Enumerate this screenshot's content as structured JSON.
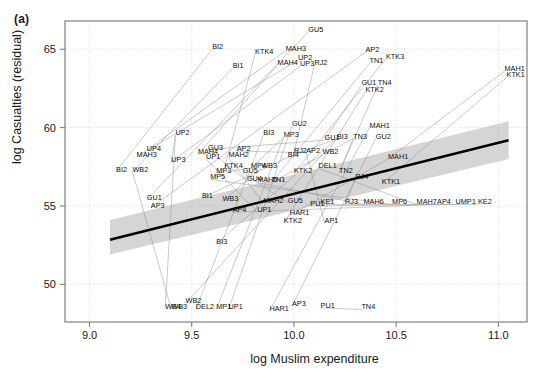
{
  "figure": {
    "panel_tag": "(a)",
    "background": "#ffffff"
  },
  "axes": {
    "x_label": "log Muslim expenditure",
    "y_label": "log Casualties (residual)",
    "x_ticks": [
      "9.0",
      "9.5",
      "10.0",
      "10.5",
      "11.0"
    ],
    "y_ticks": [
      "50",
      "55",
      "60",
      "65"
    ],
    "grid": "dotted-light-gray",
    "panel_border_color": "#808080"
  },
  "chart_data": {
    "type": "scatter",
    "title": "",
    "subtitle": "",
    "xlabel": "log Muslim expenditure",
    "ylabel": "log Casualties (residual)",
    "xlim": [
      8.88,
      11.14
    ],
    "ylim": [
      47.6,
      66.8
    ],
    "xticks": [
      9.0,
      9.5,
      10.0,
      10.5,
      11.0
    ],
    "yticks": [
      50,
      55,
      60,
      65
    ],
    "grid": true,
    "legend": "none",
    "regression_line": {
      "label": "fitted line",
      "color": "#000000",
      "x": [
        9.1,
        11.05
      ],
      "y": [
        52.85,
        59.2
      ]
    },
    "confidence_band": {
      "label": "95% confidence band",
      "color": "#b3b3b3",
      "x": [
        9.1,
        11.05
      ],
      "y_lower": [
        51.9,
        58.0
      ],
      "y_upper": [
        54.1,
        60.4
      ]
    },
    "connector_lines_color": "#8c8c8c",
    "points": [
      {
        "label": "GU5",
        "x": 10.07,
        "y": 66.1
      },
      {
        "label": "BI2",
        "x": 9.6,
        "y": 65.0
      },
      {
        "label": "KTK4",
        "x": 9.81,
        "y": 64.7
      },
      {
        "label": "MAH3",
        "x": 9.96,
        "y": 64.9
      },
      {
        "label": "AP2",
        "x": 10.35,
        "y": 64.8
      },
      {
        "label": "KTK3",
        "x": 10.45,
        "y": 64.4
      },
      {
        "label": "UP2",
        "x": 10.02,
        "y": 64.3
      },
      {
        "label": "MAH4",
        "x": 9.92,
        "y": 64.0
      },
      {
        "label": "UP3",
        "x": 10.03,
        "y": 63.9
      },
      {
        "label": "RJ2",
        "x": 10.1,
        "y": 64.0
      },
      {
        "label": "TN1",
        "x": 10.37,
        "y": 64.1
      },
      {
        "label": "BI1",
        "x": 9.7,
        "y": 63.8
      },
      {
        "label": "MAH1",
        "x": 11.03,
        "y": 63.6
      },
      {
        "label": "KTK1",
        "x": 11.04,
        "y": 63.2
      },
      {
        "label": "GU1",
        "x": 10.33,
        "y": 62.7
      },
      {
        "label": "TN4",
        "x": 10.41,
        "y": 62.7
      },
      {
        "label": "KTK2",
        "x": 10.35,
        "y": 62.3
      },
      {
        "label": "GU2b",
        "x": 9.99,
        "y": 60.1
      },
      {
        "label": "MAH1b",
        "x": 10.37,
        "y": 60.0
      },
      {
        "label": "UP2b",
        "x": 9.42,
        "y": 59.5
      },
      {
        "label": "BI3",
        "x": 9.85,
        "y": 59.5
      },
      {
        "label": "MP3",
        "x": 9.95,
        "y": 59.4
      },
      {
        "label": "GU2",
        "x": 10.4,
        "y": 59.3
      },
      {
        "label": "BI3b",
        "x": 10.21,
        "y": 59.3
      },
      {
        "label": "TN3",
        "x": 10.29,
        "y": 59.3
      },
      {
        "label": "GU1b",
        "x": 10.15,
        "y": 59.2
      },
      {
        "label": "UP4",
        "x": 9.28,
        "y": 58.5
      },
      {
        "label": "GU3",
        "x": 9.58,
        "y": 58.6
      },
      {
        "label": "AP2b",
        "x": 9.72,
        "y": 58.5
      },
      {
        "label": "MAH4b",
        "x": 9.53,
        "y": 58.3
      },
      {
        "label": "RJ2b",
        "x": 10.0,
        "y": 58.4
      },
      {
        "label": "AP2c",
        "x": 10.06,
        "y": 58.4
      },
      {
        "label": "WB2",
        "x": 10.14,
        "y": 58.3
      },
      {
        "label": "MAH3b",
        "x": 9.23,
        "y": 58.1
      },
      {
        "label": "MAH2",
        "x": 9.68,
        "y": 58.1
      },
      {
        "label": "UP1",
        "x": 9.57,
        "y": 58.0
      },
      {
        "label": "BI4",
        "x": 9.97,
        "y": 58.1
      },
      {
        "label": "MAH1c",
        "x": 10.46,
        "y": 58.0
      },
      {
        "label": "UP3b",
        "x": 9.4,
        "y": 57.8
      },
      {
        "label": "KTK4b",
        "x": 9.66,
        "y": 57.4
      },
      {
        "label": "MP4",
        "x": 9.79,
        "y": 57.4
      },
      {
        "label": "WB3",
        "x": 9.84,
        "y": 57.4
      },
      {
        "label": "DEL1",
        "x": 10.12,
        "y": 57.4
      },
      {
        "label": "BI2b",
        "x": 9.13,
        "y": 57.2
      },
      {
        "label": "WB2b",
        "x": 9.21,
        "y": 57.2
      },
      {
        "label": "MP3b",
        "x": 9.62,
        "y": 57.1
      },
      {
        "label": "GU5b",
        "x": 9.75,
        "y": 57.1
      },
      {
        "label": "KTK2b",
        "x": 10.0,
        "y": 57.1
      },
      {
        "label": "TN2",
        "x": 10.22,
        "y": 57.1
      },
      {
        "label": "MP5",
        "x": 9.59,
        "y": 56.7
      },
      {
        "label": "GU4",
        "x": 9.77,
        "y": 56.6
      },
      {
        "label": "MAH5",
        "x": 9.82,
        "y": 56.5
      },
      {
        "label": "TN1b",
        "x": 9.89,
        "y": 56.5
      },
      {
        "label": "RJ4",
        "x": 10.3,
        "y": 56.7
      },
      {
        "label": "KTK1b",
        "x": 10.43,
        "y": 56.4
      },
      {
        "label": "GU1c",
        "x": 9.28,
        "y": 55.4
      },
      {
        "label": "BI1b",
        "x": 9.55,
        "y": 55.5
      },
      {
        "label": "WB3b",
        "x": 9.65,
        "y": 55.3
      },
      {
        "label": "MAH2b",
        "x": 9.85,
        "y": 55.2
      },
      {
        "label": "GU5c",
        "x": 9.97,
        "y": 55.2
      },
      {
        "label": "KE1",
        "x": 10.13,
        "y": 55.1
      },
      {
        "label": "RJ3",
        "x": 10.25,
        "y": 55.1
      },
      {
        "label": "MAH6",
        "x": 10.34,
        "y": 55.1
      },
      {
        "label": "MP6",
        "x": 10.48,
        "y": 55.1
      },
      {
        "label": "MAH7",
        "x": 10.6,
        "y": 55.1
      },
      {
        "label": "AP4b",
        "x": 10.7,
        "y": 55.1
      },
      {
        "label": "UMP1",
        "x": 10.79,
        "y": 55.1
      },
      {
        "label": "KE2",
        "x": 10.9,
        "y": 55.1
      },
      {
        "label": "AP3",
        "x": 9.3,
        "y": 54.9
      },
      {
        "label": "AP4",
        "x": 9.7,
        "y": 54.6
      },
      {
        "label": "UP1b",
        "x": 9.82,
        "y": 54.6
      },
      {
        "label": "KTK2c",
        "x": 9.95,
        "y": 53.9
      },
      {
        "label": "AP1",
        "x": 10.15,
        "y": 53.9
      },
      {
        "label": "BI3c",
        "x": 9.62,
        "y": 52.6
      },
      {
        "label": "WB4",
        "x": 9.37,
        "y": 48.4
      },
      {
        "label": "WB3c",
        "x": 9.4,
        "y": 48.4
      },
      {
        "label": "DEL2",
        "x": 9.52,
        "y": 48.4
      },
      {
        "label": "MP1",
        "x": 9.62,
        "y": 48.4
      },
      {
        "label": "UP1c",
        "x": 9.68,
        "y": 48.4
      },
      {
        "label": "HAR1",
        "x": 9.88,
        "y": 48.3
      },
      {
        "label": "AP3b",
        "x": 9.99,
        "y": 48.6
      },
      {
        "label": "PU1",
        "x": 10.13,
        "y": 48.5
      },
      {
        "label": "TN4b",
        "x": 10.33,
        "y": 48.4
      },
      {
        "label": "WB2c",
        "x": 9.47,
        "y": 48.8
      },
      {
        "label": "PU1b",
        "x": 10.08,
        "y": 55.0
      },
      {
        "label": "HAR1b",
        "x": 9.98,
        "y": 54.4
      }
    ],
    "connectors": [
      {
        "from": "BI2b",
        "to": "BI2"
      },
      {
        "from": "WB2b",
        "to": "BI1"
      },
      {
        "from": "GU1c",
        "to": "GU5"
      },
      {
        "from": "AP3",
        "to": "AP2"
      },
      {
        "from": "UP4",
        "to": "UP2"
      },
      {
        "from": "MAH3b",
        "to": "MAH3"
      },
      {
        "from": "UP3b",
        "to": "UP3"
      },
      {
        "from": "KTK4b",
        "to": "KTK4"
      },
      {
        "from": "MAH4b",
        "to": "MAH4"
      },
      {
        "from": "RJ2b",
        "to": "RJ2"
      },
      {
        "from": "TN1b",
        "to": "TN1"
      },
      {
        "from": "KTK2b",
        "to": "KTK3"
      },
      {
        "from": "KTK1b",
        "to": "KTK1"
      },
      {
        "from": "MAH1c",
        "to": "MAH1"
      },
      {
        "from": "GU1b",
        "to": "GU1"
      },
      {
        "from": "TN2",
        "to": "TN4"
      },
      {
        "from": "WB4",
        "to": "UP2b"
      },
      {
        "from": "DEL2",
        "to": "BI3"
      },
      {
        "from": "MP1",
        "to": "MP3"
      },
      {
        "from": "UP1c",
        "to": "GU2b"
      },
      {
        "from": "HAR1",
        "to": "MAH1b"
      },
      {
        "from": "AP3b",
        "to": "GU2"
      },
      {
        "from": "PU1",
        "to": "TN4b"
      },
      {
        "from": "BI3c",
        "to": "BI3b"
      },
      {
        "from": "WB2c",
        "to": "WB2"
      },
      {
        "from": "KTK2c",
        "to": "KTK2"
      },
      {
        "from": "AP1",
        "to": "AP2c"
      },
      {
        "from": "AP4",
        "to": "AP4b"
      },
      {
        "from": "UP1b",
        "to": "UP1"
      },
      {
        "from": "MP3b",
        "to": "MP4"
      },
      {
        "from": "GU5b",
        "to": "GU5c"
      },
      {
        "from": "MAH2b",
        "to": "MAH2"
      },
      {
        "from": "WB3b",
        "to": "WB3"
      },
      {
        "from": "BI1b",
        "to": "BI4"
      },
      {
        "from": "MP5",
        "to": "MP6"
      },
      {
        "from": "GU4",
        "to": "GU3"
      },
      {
        "from": "MAH5",
        "to": "MAH6"
      },
      {
        "from": "RJ3",
        "to": "RJ4"
      },
      {
        "from": "KE1",
        "to": "KE2"
      },
      {
        "from": "TN3",
        "to": "TN2"
      },
      {
        "from": "DEL1",
        "to": "MAH7"
      },
      {
        "from": "WB3c",
        "to": "WB2b"
      },
      {
        "from": "PU1b",
        "to": "UMP1"
      },
      {
        "from": "HAR1b",
        "to": "MAH1c"
      },
      {
        "from": "AP2b",
        "to": "AP2c"
      },
      {
        "from": "GU3",
        "to": "GU1b"
      },
      {
        "from": "BI4",
        "to": "BI3b"
      },
      {
        "from": "UP2b",
        "to": "UP3b"
      },
      {
        "from": "MP4",
        "to": "MP3"
      },
      {
        "from": "TN1b",
        "to": "TN3"
      }
    ]
  }
}
